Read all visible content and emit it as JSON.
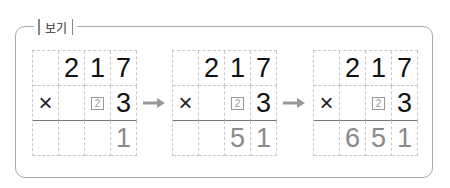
{
  "label": "보기",
  "grids": [
    {
      "rows": [
        [
          "",
          "2",
          "1",
          "7"
        ],
        [
          "×",
          "",
          "2",
          "3"
        ],
        [
          "",
          "",
          "",
          "1"
        ]
      ]
    },
    {
      "rows": [
        [
          "",
          "2",
          "1",
          "7"
        ],
        [
          "×",
          "",
          "2",
          "3"
        ],
        [
          "",
          "",
          "5",
          "1"
        ]
      ]
    },
    {
      "rows": [
        [
          "",
          "2",
          "1",
          "7"
        ],
        [
          "×",
          "",
          "2",
          "3"
        ],
        [
          "",
          "6",
          "5",
          "1"
        ]
      ]
    }
  ],
  "arrow_icon": "right-arrow-icon",
  "colors": {
    "border": "#a8a8a8",
    "result": "#8a8a8a",
    "arrow": "#999999"
  }
}
